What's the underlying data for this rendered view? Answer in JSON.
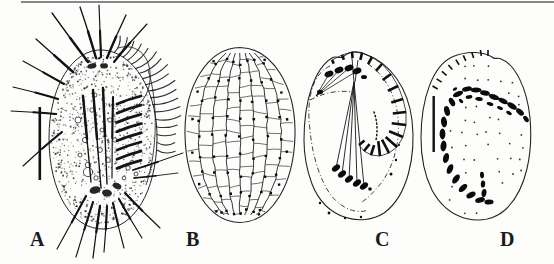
{
  "figure": {
    "panels": [
      {
        "label": "A",
        "name": "live-specimen-drawing"
      },
      {
        "label": "B",
        "name": "silverline-system-grid"
      },
      {
        "label": "C",
        "name": "ventral-infraciliature"
      },
      {
        "label": "D",
        "name": "dorsal-view-macronucleus"
      }
    ]
  },
  "colors": {
    "ink": "#1a1a1a",
    "outline": "#242424",
    "rule": "#878787",
    "background": "#fdfdfc"
  }
}
